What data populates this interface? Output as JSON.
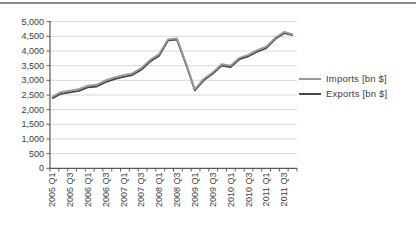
{
  "figure": {
    "background": "#ffffff",
    "top_rule_color": "#8c8c8c"
  },
  "chart_data": {
    "type": "line",
    "title": "",
    "xlabel": "",
    "ylabel": "",
    "ylim": [
      0,
      5000
    ],
    "grid": "horizontal",
    "grid_color": "#d8d8d8",
    "axis_color": "#595959",
    "tick_label_color": "#3d3d3d",
    "legend_position": "right",
    "y_axis": {
      "values": [
        0,
        500,
        1000,
        1500,
        2000,
        2500,
        3000,
        3500,
        4000,
        4500,
        5000
      ],
      "labels": [
        "0",
        "500",
        "1,000",
        "1,500",
        "2,000",
        "2,500",
        "3,000",
        "3,500",
        "4,000",
        "4,500",
        "5,000"
      ]
    },
    "categories": [
      "2005 Q1",
      "2005 Q2",
      "2005 Q3",
      "2005 Q4",
      "2006 Q1",
      "2006 Q2",
      "2006 Q3",
      "2006 Q4",
      "2007 Q1",
      "2007 Q2",
      "2007 Q3",
      "2007 Q4",
      "2008 Q1",
      "2008 Q2",
      "2008 Q3",
      "2008 Q4",
      "2009 Q1",
      "2009 Q2",
      "2009 Q3",
      "2009 Q4",
      "2010 Q1",
      "2010 Q2",
      "2010 Q3",
      "2010 Q4",
      "2011 Q1",
      "2011 Q2",
      "2011 Q3",
      "2011 Q4"
    ],
    "x_tick_label_indices": [
      0,
      2,
      4,
      6,
      8,
      10,
      12,
      14,
      16,
      18,
      20,
      22,
      24,
      26
    ],
    "x_tick_labels_shown": [
      "2005 Q1",
      "2005 Q3",
      "2006 Q1",
      "2006 Q3",
      "2007 Q1",
      "2007 Q3",
      "2008 Q1",
      "2008 Q3",
      "2009 Q1",
      "2009 Q3",
      "2010 Q1",
      "2010 Q3",
      "2011 Q1",
      "2011 Q3"
    ],
    "series": [
      {
        "name": "Imports [bn $]",
        "color": "#9b9b9b",
        "values": [
          2440,
          2600,
          2650,
          2700,
          2820,
          2850,
          3000,
          3100,
          3180,
          3240,
          3420,
          3700,
          3900,
          4400,
          4430,
          3600,
          2700,
          3050,
          3270,
          3550,
          3500,
          3770,
          3870,
          4030,
          4150,
          4450,
          4650,
          4570
        ]
      },
      {
        "name": "Exports [bn $]",
        "color": "#454545",
        "values": [
          2380,
          2540,
          2590,
          2640,
          2760,
          2790,
          2940,
          3040,
          3120,
          3180,
          3360,
          3640,
          3840,
          4360,
          4390,
          3560,
          2660,
          3000,
          3220,
          3500,
          3450,
          3720,
          3820,
          3980,
          4100,
          4410,
          4610,
          4540
        ]
      }
    ]
  }
}
